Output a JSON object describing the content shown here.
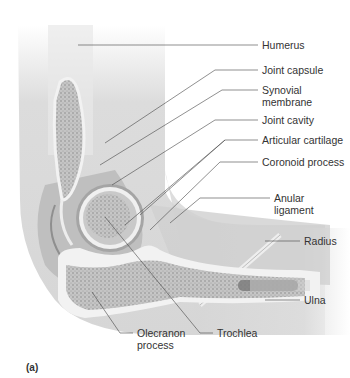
{
  "figure": {
    "panel_label": "(a)",
    "labels": [
      {
        "id": "humerus",
        "text": "Humerus"
      },
      {
        "id": "joint-capsule",
        "text": "Joint capsule"
      },
      {
        "id": "synovial-membrane",
        "line1": "Synovial",
        "line2": "membrane"
      },
      {
        "id": "joint-cavity",
        "text": "Joint cavity"
      },
      {
        "id": "articular-cartilage",
        "text": "Articular cartilage"
      },
      {
        "id": "coronoid-process",
        "text": "Coronoid process"
      },
      {
        "id": "anular-ligament",
        "line1": "Anular",
        "line2": "ligament"
      },
      {
        "id": "radius",
        "text": "Radius"
      },
      {
        "id": "ulna",
        "text": "Ulna"
      },
      {
        "id": "olecranon-process",
        "line1": "Olecranon",
        "line2": "process"
      },
      {
        "id": "trochlea",
        "text": "Trochlea"
      }
    ],
    "colors": {
      "skin": "#dcdcdc",
      "bone_spongy": "#b5b5b5",
      "bone_compact": "#ececec",
      "cartilage": "#e6e6e6",
      "leader_line": "#444444",
      "text": "#333333"
    }
  }
}
